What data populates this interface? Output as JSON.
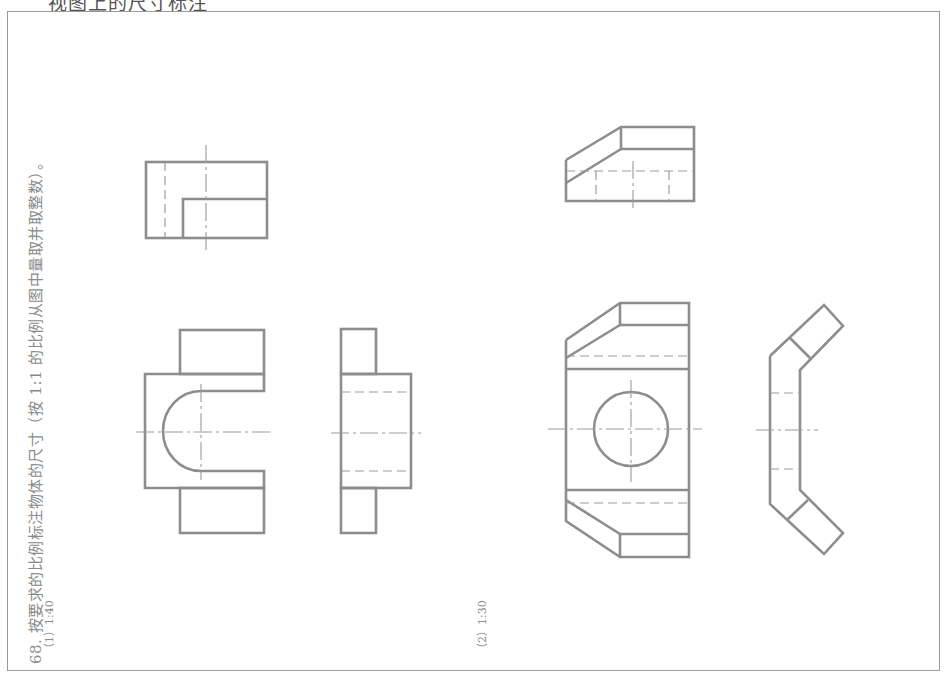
{
  "header": {
    "title": "视图上的尺寸标注"
  },
  "question": {
    "number": "68.",
    "text": "68. 按要求的比例标注物体的尺寸（按 1:1 的比例从图中量取并取整数）。"
  },
  "problems": [
    {
      "label": "（1）1:40",
      "views": [
        "top-view",
        "front-view",
        "side-view"
      ]
    },
    {
      "label": "（2）1:30",
      "views": [
        "top-view",
        "front-view",
        "side-view"
      ]
    }
  ],
  "colors": {
    "line": "#8d8d8d",
    "frame": "#9a9a9a",
    "text": "#8a8a8a"
  }
}
